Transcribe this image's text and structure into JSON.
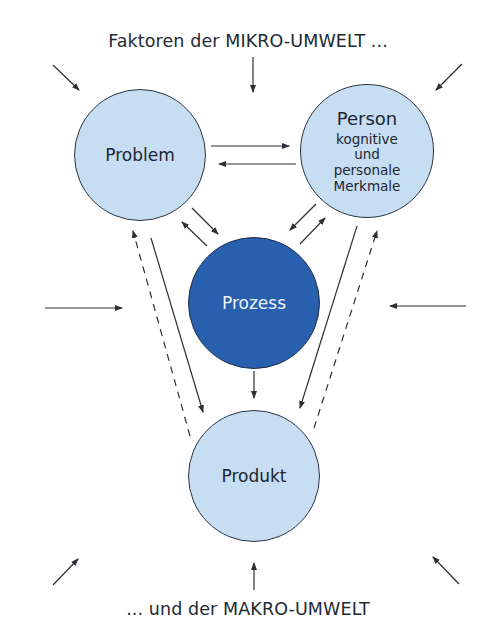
{
  "diagram": {
    "top_caption": "Faktoren der MIKRO-UMWELT ...",
    "bottom_caption": "... und der MAKRO-UMWELT",
    "colors": {
      "node_light": "#c6ddf2",
      "node_dark": "#2860ad",
      "node_border": "#2a3442",
      "arrow": "#2b2f36",
      "text": "#1e2630",
      "text_on_dark": "#eef3fb"
    },
    "nodes": [
      {
        "id": "problem",
        "label": "Problem",
        "cx": 140,
        "cy": 155,
        "r": 66,
        "style": "light"
      },
      {
        "id": "person",
        "label": "Person",
        "sublines": [
          "kognitive",
          "und",
          "personale",
          "Merkmale"
        ],
        "cx": 367,
        "cy": 151,
        "r": 67,
        "style": "light"
      },
      {
        "id": "prozess",
        "label": "Prozess",
        "cx": 254,
        "cy": 303,
        "r": 66,
        "style": "dark"
      },
      {
        "id": "produkt",
        "label": "Produkt",
        "cx": 254,
        "cy": 476,
        "r": 66,
        "style": "light"
      }
    ],
    "edges": [
      {
        "from": "problem",
        "to": "person",
        "style": "solid"
      },
      {
        "from": "person",
        "to": "problem",
        "style": "solid"
      },
      {
        "from": "problem",
        "to": "prozess",
        "style": "solid"
      },
      {
        "from": "prozess",
        "to": "problem",
        "style": "solid"
      },
      {
        "from": "person",
        "to": "prozess",
        "style": "solid"
      },
      {
        "from": "prozess",
        "to": "person",
        "style": "solid"
      },
      {
        "from": "prozess",
        "to": "produkt",
        "style": "solid"
      },
      {
        "from": "problem",
        "to": "produkt",
        "style": "solid"
      },
      {
        "from": "produkt",
        "to": "problem",
        "style": "dashed"
      },
      {
        "from": "person",
        "to": "produkt",
        "style": "solid"
      },
      {
        "from": "produkt",
        "to": "person",
        "style": "dashed"
      }
    ],
    "environment_arrows": [
      {
        "position": "top-left",
        "direction": "inward"
      },
      {
        "position": "top-center",
        "direction": "inward"
      },
      {
        "position": "top-right",
        "direction": "inward"
      },
      {
        "position": "middle-left",
        "direction": "inward"
      },
      {
        "position": "middle-right",
        "direction": "inward"
      },
      {
        "position": "bottom-left",
        "direction": "inward"
      },
      {
        "position": "bottom-center",
        "direction": "inward"
      },
      {
        "position": "bottom-right",
        "direction": "inward"
      }
    ]
  }
}
